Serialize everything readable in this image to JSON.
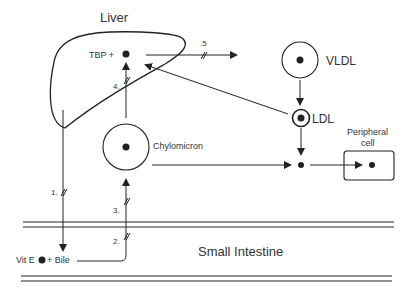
{
  "diagram": {
    "labels": {
      "liver": "Liver",
      "tbp": "TBP +",
      "vldl": "VLDL",
      "ldl": "LDL",
      "chylomicron": "Chylomicron",
      "peripheral_line1": "Peripheral",
      "peripheral_line2": "cell",
      "small_intestine": "Small Intestine",
      "vit_e": "Vit E",
      "bile": "+ Bile"
    },
    "steps": {
      "s1": "1.",
      "s2": "2.",
      "s3": "3.",
      "s4": "4.",
      "s5": ".5"
    },
    "colors": {
      "stroke": "#222222",
      "text": "#333333"
    }
  }
}
